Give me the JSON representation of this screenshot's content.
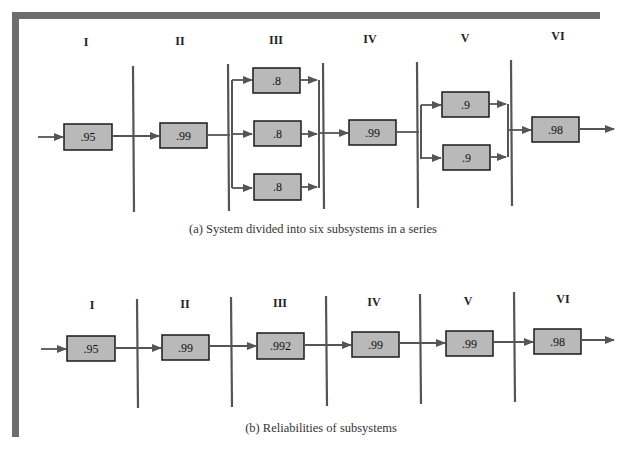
{
  "figure": {
    "panel_a": {
      "caption": "(a) System divided into six subsystems in a series",
      "subsystems": [
        {
          "label": "I",
          "components": [
            ".95"
          ],
          "arrangement": "single"
        },
        {
          "label": "II",
          "components": [
            ".99"
          ],
          "arrangement": "single"
        },
        {
          "label": "III",
          "components": [
            ".8",
            ".8",
            ".8"
          ],
          "arrangement": "parallel"
        },
        {
          "label": "IV",
          "components": [
            ".99"
          ],
          "arrangement": "single"
        },
        {
          "label": "V",
          "components": [
            ".9",
            ".9"
          ],
          "arrangement": "parallel"
        },
        {
          "label": "VI",
          "components": [
            ".98"
          ],
          "arrangement": "single"
        }
      ]
    },
    "panel_b": {
      "caption": "(b) Reliabilities of subsystems",
      "subsystems": [
        {
          "label": "I",
          "reliability": ".95"
        },
        {
          "label": "II",
          "reliability": ".99"
        },
        {
          "label": "III",
          "reliability": ".992"
        },
        {
          "label": "IV",
          "reliability": ".99"
        },
        {
          "label": "V",
          "reliability": ".99"
        },
        {
          "label": "VI",
          "reliability": ".98"
        }
      ]
    }
  },
  "colors": {
    "frame": "#6d6d6d",
    "box_fill": "#b9b9b9",
    "box_stroke": "#1a1a1a",
    "line": "#555555"
  }
}
